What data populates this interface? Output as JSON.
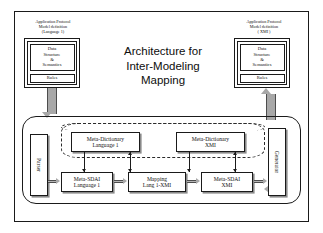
{
  "diagram": {
    "title": "Architecture for\nInter-Modeling\nMapping",
    "left_model": {
      "caption": "Application Protocol\nModel definition\n(Language 1)",
      "data_structure": "Data\nStructure\n&\nSemantics",
      "rules": "Rules"
    },
    "right_model": {
      "caption": "Application Protocol\nModel definition\n( XMI )",
      "data_structure": "Data\nStructure\n&\nSemantics",
      "rules": "Rules"
    },
    "parser": "Parser",
    "generator": "Generator",
    "dictionaries": [
      "Meta-Dictionary\nLanguage 1",
      "Meta-Dictionary\nXMI"
    ],
    "processors": [
      "Meta-SDAI\nLanguage 1",
      "Mapping\nLang 1-XMI",
      "Meta-SDAI\nXMI"
    ],
    "flow_arrows": [
      "⇒",
      "⇒",
      "⇒",
      "⇒"
    ]
  }
}
